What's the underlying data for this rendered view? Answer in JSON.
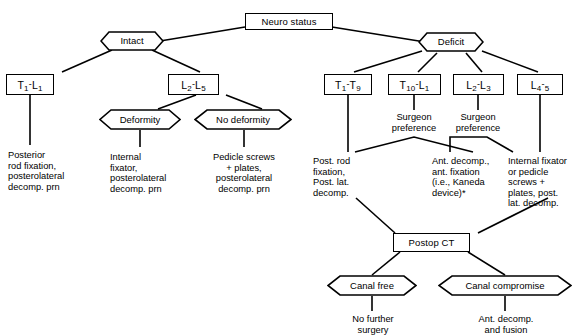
{
  "diagram": {
    "title": "Neuro status",
    "root": {
      "label": "Neuro status"
    },
    "branches": {
      "intact": {
        "label": "Intact"
      },
      "deficit": {
        "label": "Deficit"
      }
    },
    "levels": {
      "intact_t1_l1": {
        "prefix1": "T",
        "sub1": "1",
        "dash": "-",
        "prefix2": "L",
        "sub2": "1"
      },
      "intact_l2_l5": {
        "prefix1": "L",
        "sub1": "2",
        "dash": "-",
        "prefix2": "L",
        "sub2": "5"
      },
      "deficit_t1_t9": {
        "prefix1": "T",
        "sub1": "1",
        "dash": "-",
        "prefix2": "T",
        "sub2": "9"
      },
      "deficit_t10_l1": {
        "prefix1": "T",
        "sub1": "10",
        "dash": "-",
        "prefix2": "L",
        "sub2": "1"
      },
      "deficit_l2_l3": {
        "prefix1": "L",
        "sub1": "2",
        "dash": "-",
        "prefix2": "L",
        "sub2": "3"
      },
      "deficit_l4_5": {
        "prefix1": "L",
        "sub1": "4",
        "dash": "-",
        "prefix2": "",
        "sub2": "5"
      }
    },
    "deformity_nodes": {
      "deformity": {
        "label": "Deformity"
      },
      "no_deformity": {
        "label": "No deformity"
      }
    },
    "treatments": {
      "posterior_rod": "Posterior\n rod fixation,\n posterolateral\n decomp. prn",
      "internal_fixator": "Internal\n fixator,\n posterolateral\n decomp. prn",
      "pedicle_screws_plates": "Pedicle screws\n+ plates,\nposterolateral\ndecomp. prn",
      "post_rod_fixation": "Post. rod\nfixation,\nPost. lat.\ndecomp.",
      "ant_decomp_kaneda": "Ant. decomp.,\nant. fixation\n(i.e., Kaneda\ndevice)*",
      "internal_fixator_or_pedicle": "Internal fixator\nor pedicle\nscrews +\nplates, post.\nlat. decomp."
    },
    "surgeon_preference_labels": {
      "left": "Surgeon\npreference",
      "right": "Surgeon\npreference"
    },
    "postop": {
      "ct": "Postop CT",
      "canal_free": "Canal free",
      "canal_compromise": "Canal compromise",
      "no_further_surgery": "No further\nsurgery",
      "ant_decomp_fusion": "Ant. decomp.\nand fusion"
    },
    "colors": {
      "stroke": "#000000",
      "fill": "#ffffff",
      "text": "#000000"
    }
  }
}
